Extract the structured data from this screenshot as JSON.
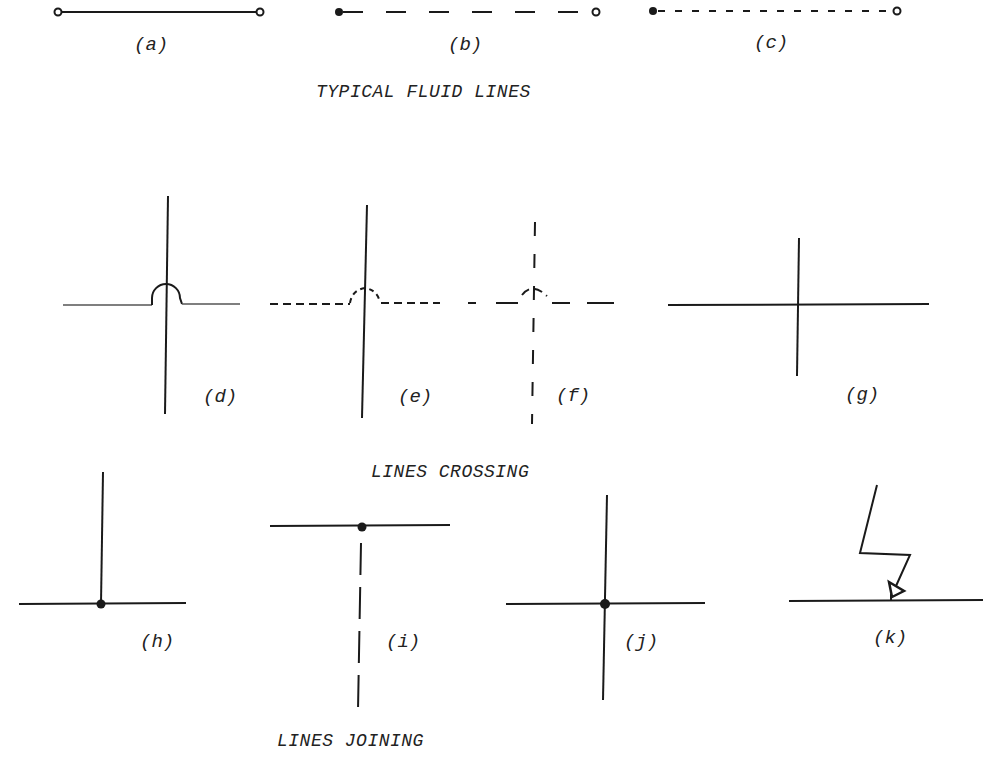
{
  "sections": {
    "fluid_lines": {
      "title": "TYPICAL FLUID LINES"
    },
    "crossing": {
      "title": "LINES CROSSING"
    },
    "joining": {
      "title": "LINES JOINING"
    }
  },
  "figures": {
    "a": {
      "label": "(a)",
      "style": "solid",
      "endpoints": "open-circle both ends"
    },
    "b": {
      "label": "(b)",
      "style": "long-dash",
      "endpoints": "filled dot start, open circle end"
    },
    "c": {
      "label": "(c)",
      "style": "short-dash",
      "endpoints": "filled dot start, open circle end"
    },
    "d": {
      "label": "(d)",
      "description": "solid horizontal line hops over solid vertical line"
    },
    "e": {
      "label": "(e)",
      "description": "dashed horizontal line hops over solid vertical line"
    },
    "f": {
      "label": "(f)",
      "description": "dashed horizontal line hops over dashed vertical line"
    },
    "g": {
      "label": "(g)",
      "description": "plain crossing without connection"
    },
    "h": {
      "label": "(h)",
      "description": "tee junction with dot"
    },
    "i": {
      "label": "(i)",
      "description": "dashed branch joins solid line at dot"
    },
    "j": {
      "label": "(j)",
      "description": "four-way junction with dot"
    },
    "k": {
      "label": "(k)",
      "description": "zig-zag signal line with arrowhead onto line"
    }
  },
  "colors": {
    "ink": "#1a1a1a",
    "background": "#ffffff"
  }
}
